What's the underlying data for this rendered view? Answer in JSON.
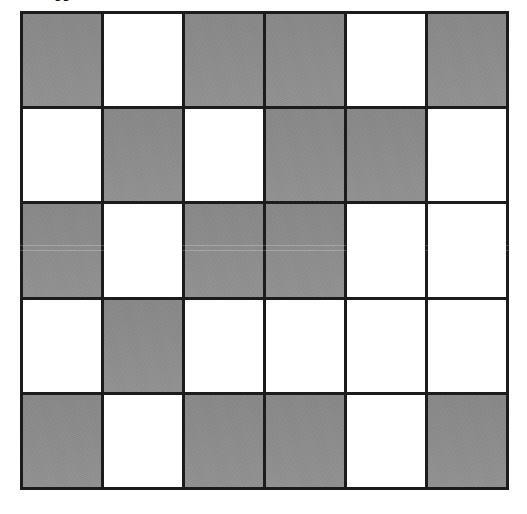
{
  "figure": {
    "caption_fragment": "rJ",
    "shape": "rectangle-grid",
    "columns": 6,
    "rows": 5,
    "total_cells": 30,
    "shaded_cells": 15,
    "unshaded_cells": 15,
    "shaded_fraction": "15/30",
    "colors": {
      "shaded": "#8c8c8c",
      "unshaded": "#ffffff",
      "gridline": "#1c1c1c",
      "background": "#ffffff"
    }
  },
  "chart_data": {
    "type": "heatmap",
    "xlabel": "",
    "ylabel": "",
    "columns": 6,
    "rows": 5,
    "legend": [
      "shaded",
      "unshaded"
    ],
    "value_labels": {
      "1": "shaded",
      "0": "unshaded"
    },
    "grid": [
      [
        1,
        0,
        1,
        1,
        0,
        1
      ],
      [
        0,
        1,
        0,
        1,
        1,
        0
      ],
      [
        1,
        0,
        1,
        1,
        0,
        0
      ],
      [
        0,
        1,
        0,
        0,
        0,
        0
      ],
      [
        1,
        0,
        1,
        1,
        0,
        1
      ]
    ],
    "row_shaded_counts": [
      4,
      3,
      3,
      1,
      4
    ],
    "column_shaded_counts": [
      3,
      2,
      3,
      4,
      1,
      2
    ],
    "shaded_total": 15,
    "cells_total": 30
  }
}
